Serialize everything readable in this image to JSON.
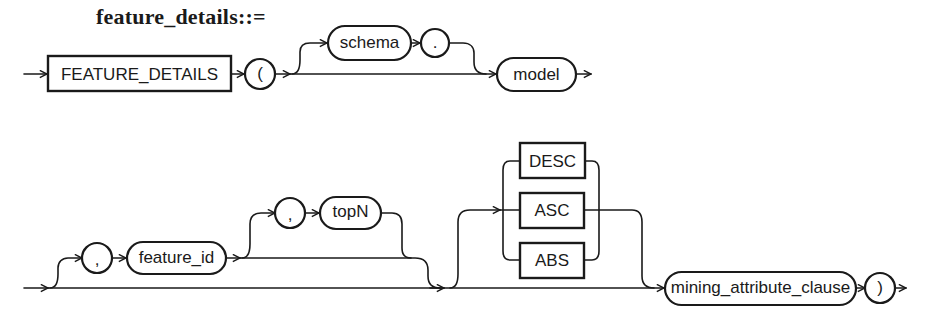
{
  "title": "feature_details::=",
  "row1": {
    "keyword": "FEATURE_DETAILS",
    "open_paren": "(",
    "schema": "schema",
    "dot": ".",
    "model": "model"
  },
  "row2": {
    "comma1": ",",
    "feature_id": "feature_id",
    "comma2": ",",
    "topN": "topN",
    "order_options": [
      "DESC",
      "ASC",
      "ABS"
    ],
    "mining_attribute_clause": "mining_attribute_clause",
    "close_paren": ")"
  },
  "colors": {
    "stroke": "#1a1a1a",
    "background": "#ffffff"
  }
}
